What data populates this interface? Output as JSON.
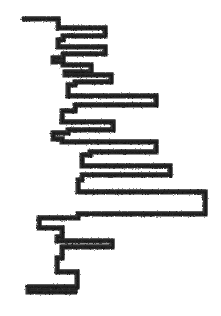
{
  "figure": {
    "title": "Hand-drawn stepped horizontal bar profile",
    "style": "hand-drawn sketch, rough charcoal stroke",
    "width": 221,
    "height": 316,
    "background_color": "#ffffff",
    "ink_color": "#1f1f1f",
    "ink_color_light": "#3a3a3a",
    "stroke_width": 4.6
  },
  "chart_data": {
    "type": "bar",
    "orientation": "horizontal",
    "title": "",
    "subtitle": "",
    "xlabel": "",
    "ylabel": "",
    "grid": false,
    "legend": null,
    "axis_visible": false,
    "tick_labels_visible": false,
    "baseline_x": 53,
    "xlim": [
      20,
      210
    ],
    "ylim": [
      16,
      296
    ],
    "categories": [
      "b1",
      "b2",
      "b3",
      "b4",
      "b5",
      "b6",
      "b7",
      "b8",
      "b9",
      "b10",
      "b11",
      "b12",
      "b13",
      "b14",
      "b15",
      "b16",
      "b17",
      "b18",
      "b19",
      "b20",
      "b21",
      "b22"
    ],
    "values": [
      58,
      105,
      58,
      105,
      63,
      91,
      111,
      75,
      156,
      75,
      113,
      68,
      156,
      90,
      170,
      78,
      205,
      78,
      39,
      112,
      62,
      77
    ],
    "bar_tops": [
      19,
      28,
      40,
      47,
      58,
      65,
      75,
      85,
      96,
      111,
      122,
      133,
      142,
      155,
      166,
      180,
      192,
      218,
      228,
      241,
      258,
      272
    ],
    "bar_bottoms": [
      24,
      36,
      45,
      54,
      62,
      72,
      82,
      93,
      105,
      119,
      130,
      139,
      152,
      163,
      175,
      188,
      214,
      226,
      237,
      254,
      268,
      292
    ],
    "left_edge_x": 22
  },
  "geometry": {
    "outline_path": "M22,19 L58,19 L58,28 L105,28 L105,36 L63,36 L63,40 L58,40 L58,47 L105,47 L105,54 L63,54 L63,58 L53,58 L53,62 L63,62 L63,65 L91,65 L91,72 L65,72 L65,75 L111,75 L111,82 L75,82 L75,85 L68,85 L68,96 L156,96 L156,105 L75,105 L75,111 L62,111 L62,122 L113,122 L113,130 L68,130 L68,133 L53,133 L53,139 L62,139 L62,142 L156,142 L156,152 L90,152 L90,155 L82,155 L82,166 L170,166 L170,175 L82,175 L82,180 L78,180 L78,192 L205,192 L205,214 L78,214 L78,218 L39,218 L39,228 L62,228 L62,237 L57,237 L57,241 L112,241 L112,247 L62,247 L62,258 L57,258 L57,272 L77,272 L77,287 L28,287 L28,292 L77,292",
    "segments": 22
  },
  "meta": {
    "icon_names": [
      "sketch-figure-icon"
    ]
  }
}
